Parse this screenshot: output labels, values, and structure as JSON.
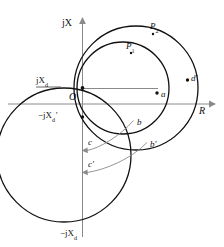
{
  "figure": {
    "type": "phasor-circle-diagram",
    "background_color": "#ffffff",
    "line_color": "#111111",
    "axis_color": "#808080",
    "width": 224,
    "height": 247
  },
  "axes": {
    "vertical": {
      "label": "jX",
      "label_plain": "jX",
      "x": 82,
      "top_y": 18,
      "bottom_y": 237,
      "arrow": "up"
    },
    "horizontal": {
      "label": "R",
      "y": 104,
      "left_x": 8,
      "right_x": 214,
      "arrow": "right"
    },
    "origin_label": "O"
  },
  "labels": {
    "jX": "jX",
    "R": "R",
    "O": "O",
    "jXd": "jX",
    "jXd_sub": "d",
    "neg_jXd_prime": "−jX",
    "neg_jXd_prime_sub": "d",
    "neg_jXd_prime_mark": "′",
    "neg_jXd": "−jX",
    "neg_jXd_sub": "d",
    "P1": "P",
    "P1_sub": "1",
    "P2": "P",
    "P2_sub": "2",
    "a": "a",
    "b": "b",
    "b_prime": "b′",
    "c": "c",
    "c_prime": "c′",
    "d_prime": "d′"
  },
  "points": [
    {
      "name": "jXd",
      "label": "jXd",
      "x": 82,
      "y": 88
    },
    {
      "name": "neg-jXd-prime",
      "label": "-jXd'",
      "x": 82,
      "y": 117
    },
    {
      "name": "neg-jXd",
      "label": "-jXd",
      "x": 82,
      "y": 222
    },
    {
      "name": "a",
      "label": "a",
      "x": 157,
      "y": 93
    },
    {
      "name": "b",
      "label": "b",
      "x": 133,
      "y": 120
    },
    {
      "name": "b-prime",
      "label": "b'",
      "x": 146,
      "y": 142
    },
    {
      "name": "c",
      "label": "c",
      "x": 82,
      "y": 150
    },
    {
      "name": "c-prime",
      "label": "c'",
      "x": 82,
      "y": 172
    },
    {
      "name": "d-prime",
      "label": "d'",
      "x": 187,
      "y": 80
    },
    {
      "name": "P1",
      "label": "P1",
      "x": 131,
      "y": 50
    },
    {
      "name": "P2",
      "label": "P2",
      "x": 154,
      "y": 31
    }
  ],
  "circles": [
    {
      "name": "circle-P1",
      "cx": 123,
      "cy": 88,
      "r": 46,
      "stroke_width": 1.2
    },
    {
      "name": "circle-P2",
      "cx": 136,
      "cy": 88,
      "r": 62,
      "stroke_width": 1.2
    },
    {
      "name": "circle-lower-left",
      "cx": 64,
      "cy": 155,
      "r": 67,
      "stroke_width": 1.2
    }
  ],
  "segments": [
    {
      "name": "radius-line-jXd-to-a",
      "x1": 82,
      "y1": 88,
      "x2": 157,
      "y2": 93
    }
  ],
  "arcs": [
    {
      "name": "arc-b-to-c",
      "from": "b",
      "to": "c",
      "label": "c"
    },
    {
      "name": "arc-bprime-to-cprime",
      "from": "b-prime",
      "to": "c-prime",
      "label": "c'"
    }
  ]
}
